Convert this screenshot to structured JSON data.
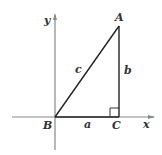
{
  "diagram": {
    "axes": {
      "x_label": "x",
      "y_label": "y"
    },
    "vertices": {
      "A": "A",
      "B": "B",
      "C": "C"
    },
    "sides": {
      "a": "a",
      "b": "b",
      "c": "c"
    },
    "colors": {
      "axis": "#888888",
      "triangle": "#222222"
    }
  }
}
